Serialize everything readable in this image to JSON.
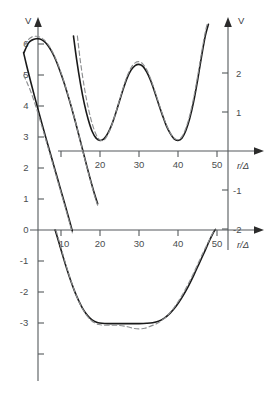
{
  "figure": {
    "name": "dual-axis-potential-plot",
    "background": "#ffffff",
    "width": 272,
    "height": 395,
    "colors": {
      "solid_curve": "#1a1a1a",
      "dashed_curve": "#8d8f91",
      "axis": "#55595c",
      "label": "#4a4e50"
    }
  },
  "chart_data": {
    "type": "line",
    "title": "",
    "subtitle": "",
    "grid": false,
    "legend": null,
    "axes": [
      {
        "id": "left-axis",
        "orientation": "vertical",
        "label": "V",
        "position": "left",
        "ticks": [
          6,
          5,
          4,
          3,
          2,
          1,
          0,
          -1,
          -2,
          -3
        ],
        "tick_labels": [
          "6",
          "5",
          "4",
          "3",
          "2",
          "1",
          "0",
          "-1",
          "-2",
          "-3"
        ],
        "range": [
          -3.3,
          6.6
        ]
      },
      {
        "id": "bottom-x-axis",
        "orientation": "horizontal",
        "label": "r/Δ",
        "position": "bottom",
        "ticks": [
          10,
          20,
          30,
          40,
          50
        ],
        "tick_labels": [
          "10",
          "20",
          "30",
          "40",
          "50"
        ],
        "range": [
          0,
          58
        ]
      },
      {
        "id": "right-axis",
        "orientation": "vertical",
        "label": "V",
        "position": "right",
        "ticks": [
          2,
          1,
          -1,
          -2
        ],
        "tick_labels": [
          "2",
          "1",
          "-1",
          "-2"
        ],
        "range": [
          -2.6,
          2.9
        ]
      },
      {
        "id": "middle-x-axis",
        "orientation": "horizontal",
        "label": "r/Δ",
        "position": "middle",
        "ticks": [
          20,
          30,
          40,
          50
        ],
        "tick_labels": [
          "20",
          "30",
          "40",
          "50"
        ],
        "range": [
          12,
          58
        ]
      }
    ],
    "xlabel": "r/Δ",
    "ylabel": "V",
    "series": [
      {
        "name": "upper-branch-solid",
        "style": "solid",
        "axis": "left",
        "points": [
          [
            0.5,
            5.72
          ],
          [
            1.6,
            6.02
          ],
          [
            2.6,
            6.13
          ],
          [
            3.6,
            6.17
          ],
          [
            4.6,
            6.16
          ],
          [
            5.6,
            6.09
          ],
          [
            6.6,
            5.96
          ],
          [
            7.6,
            5.76
          ],
          [
            8.6,
            5.5
          ],
          [
            9.6,
            5.18
          ],
          [
            10.6,
            4.82
          ],
          [
            11.6,
            4.42
          ],
          [
            12.6,
            3.99
          ],
          [
            13.6,
            3.53
          ],
          [
            14.6,
            3.05
          ],
          [
            15.6,
            2.56
          ],
          [
            16.6,
            2.07
          ],
          [
            17.6,
            1.6
          ],
          [
            18.6,
            1.16
          ],
          [
            19.4,
            0.85
          ]
        ]
      },
      {
        "name": "upper-branch-dashed",
        "style": "dashed",
        "axis": "left",
        "points": [
          [
            0.6,
            5.95
          ],
          [
            1.6,
            6.14
          ],
          [
            2.6,
            6.23
          ],
          [
            3.6,
            6.25
          ],
          [
            4.6,
            6.22
          ],
          [
            5.6,
            6.14
          ],
          [
            6.6,
            6.0
          ],
          [
            7.6,
            5.8
          ],
          [
            8.6,
            5.54
          ],
          [
            9.6,
            5.22
          ],
          [
            10.6,
            4.85
          ],
          [
            11.6,
            4.44
          ],
          [
            12.6,
            4.0
          ],
          [
            13.6,
            3.53
          ],
          [
            14.6,
            3.04
          ],
          [
            15.6,
            2.54
          ],
          [
            16.6,
            2.04
          ],
          [
            17.6,
            1.56
          ],
          [
            18.6,
            1.11
          ],
          [
            19.4,
            0.79
          ]
        ]
      },
      {
        "name": "steep-branch-solid",
        "style": "solid",
        "axis": "left",
        "points": [
          [
            0.4,
            5.72
          ],
          [
            1.2,
            5.3
          ],
          [
            2.2,
            4.8
          ],
          [
            3.2,
            4.32
          ],
          [
            4.2,
            3.85
          ],
          [
            5.2,
            3.39
          ],
          [
            6.2,
            2.94
          ],
          [
            7.2,
            2.5
          ],
          [
            8.2,
            2.06
          ],
          [
            9.2,
            1.62
          ],
          [
            10.2,
            1.18
          ],
          [
            11.2,
            0.74
          ],
          [
            12.2,
            0.29
          ],
          [
            12.9,
            -0.03
          ]
        ]
      },
      {
        "name": "steep-branch-dashed",
        "style": "dashed",
        "axis": "left",
        "points": [
          [
            0.4,
            5.0
          ],
          [
            1.2,
            4.78
          ],
          [
            2.2,
            4.48
          ],
          [
            3.2,
            4.12
          ],
          [
            4.2,
            3.72
          ],
          [
            5.2,
            3.3
          ],
          [
            6.2,
            2.87
          ],
          [
            7.2,
            2.44
          ],
          [
            8.2,
            2.0
          ],
          [
            9.2,
            1.56
          ],
          [
            10.2,
            1.12
          ],
          [
            11.2,
            0.68
          ],
          [
            12.2,
            0.23
          ],
          [
            12.9,
            -0.09
          ]
        ]
      },
      {
        "name": "oscillating-curve-solid",
        "style": "solid",
        "axis": "right",
        "comment": "double-well oscillation with minima near r=20 and r=40, local maximum near r=30",
        "points": [
          [
            13.2,
            2.95
          ],
          [
            14.0,
            2.35
          ],
          [
            15.0,
            1.72
          ],
          [
            16.0,
            1.2
          ],
          [
            17.0,
            0.8
          ],
          [
            18.0,
            0.5
          ],
          [
            19.0,
            0.33
          ],
          [
            20.0,
            0.27
          ],
          [
            21.0,
            0.31
          ],
          [
            22.0,
            0.45
          ],
          [
            23.0,
            0.67
          ],
          [
            24.0,
            0.96
          ],
          [
            25.0,
            1.28
          ],
          [
            26.0,
            1.6
          ],
          [
            27.0,
            1.88
          ],
          [
            28.0,
            2.08
          ],
          [
            29.0,
            2.19
          ],
          [
            30.0,
            2.22
          ],
          [
            31.0,
            2.17
          ],
          [
            32.0,
            2.02
          ],
          [
            33.0,
            1.8
          ],
          [
            34.0,
            1.52
          ],
          [
            35.0,
            1.21
          ],
          [
            36.0,
            0.92
          ],
          [
            37.0,
            0.65
          ],
          [
            38.0,
            0.45
          ],
          [
            39.0,
            0.31
          ],
          [
            40.0,
            0.27
          ],
          [
            41.0,
            0.33
          ],
          [
            42.0,
            0.52
          ],
          [
            43.0,
            0.83
          ],
          [
            44.0,
            1.26
          ],
          [
            45.0,
            1.8
          ],
          [
            46.0,
            2.4
          ],
          [
            47.0,
            2.95
          ],
          [
            47.8,
            3.25
          ]
        ]
      },
      {
        "name": "oscillating-curve-dashed",
        "style": "dashed",
        "axis": "right",
        "points": [
          [
            14.2,
            2.95
          ],
          [
            15.0,
            2.28
          ],
          [
            16.0,
            1.62
          ],
          [
            17.0,
            1.1
          ],
          [
            18.0,
            0.7
          ],
          [
            19.0,
            0.42
          ],
          [
            20.0,
            0.28
          ],
          [
            21.0,
            0.28
          ],
          [
            22.0,
            0.42
          ],
          [
            23.0,
            0.66
          ],
          [
            24.0,
            0.97
          ],
          [
            25.0,
            1.31
          ],
          [
            26.0,
            1.64
          ],
          [
            27.0,
            1.93
          ],
          [
            28.0,
            2.14
          ],
          [
            29.0,
            2.26
          ],
          [
            30.0,
            2.29
          ],
          [
            31.0,
            2.23
          ],
          [
            32.0,
            2.08
          ],
          [
            33.0,
            1.85
          ],
          [
            34.0,
            1.56
          ],
          [
            35.0,
            1.25
          ],
          [
            36.0,
            0.95
          ],
          [
            37.0,
            0.68
          ],
          [
            38.0,
            0.47
          ],
          [
            39.0,
            0.33
          ],
          [
            40.0,
            0.29
          ],
          [
            41.0,
            0.37
          ],
          [
            42.0,
            0.58
          ],
          [
            43.0,
            0.91
          ],
          [
            44.0,
            1.36
          ],
          [
            45.0,
            1.9
          ],
          [
            46.0,
            2.5
          ],
          [
            47.0,
            3.05
          ],
          [
            47.6,
            3.3
          ]
        ]
      },
      {
        "name": "lower-well-solid",
        "style": "solid",
        "axis": "left",
        "comment": "deep flat-bottomed well reaching -3.0 between r=20 and r=35",
        "points": [
          [
            8.5,
            0.0
          ],
          [
            9.5,
            -0.42
          ],
          [
            10.5,
            -0.85
          ],
          [
            11.5,
            -1.26
          ],
          [
            12.5,
            -1.64
          ],
          [
            13.5,
            -1.98
          ],
          [
            14.5,
            -2.27
          ],
          [
            15.5,
            -2.52
          ],
          [
            16.5,
            -2.71
          ],
          [
            17.5,
            -2.85
          ],
          [
            18.5,
            -2.94
          ],
          [
            19.5,
            -2.99
          ],
          [
            20.5,
            -3.01
          ],
          [
            22.0,
            -3.02
          ],
          [
            24.0,
            -3.02
          ],
          [
            26.0,
            -3.02
          ],
          [
            28.0,
            -3.02
          ],
          [
            30.0,
            -3.02
          ],
          [
            32.0,
            -3.01
          ],
          [
            33.5,
            -2.99
          ],
          [
            35.0,
            -2.94
          ],
          [
            36.5,
            -2.84
          ],
          [
            38.0,
            -2.68
          ],
          [
            39.5,
            -2.46
          ],
          [
            41.0,
            -2.18
          ],
          [
            42.5,
            -1.85
          ],
          [
            44.0,
            -1.47
          ],
          [
            45.5,
            -1.06
          ],
          [
            47.0,
            -0.65
          ],
          [
            48.0,
            -0.36
          ],
          [
            49.0,
            -0.1
          ],
          [
            49.6,
            0.02
          ]
        ]
      },
      {
        "name": "lower-well-dashed",
        "style": "dashed",
        "axis": "left",
        "points": [
          [
            8.7,
            0.0
          ],
          [
            9.7,
            -0.44
          ],
          [
            10.7,
            -0.88
          ],
          [
            11.7,
            -1.3
          ],
          [
            12.7,
            -1.69
          ],
          [
            13.7,
            -2.04
          ],
          [
            14.7,
            -2.34
          ],
          [
            15.7,
            -2.58
          ],
          [
            16.7,
            -2.77
          ],
          [
            17.7,
            -2.91
          ],
          [
            18.7,
            -3.0
          ],
          [
            19.7,
            -3.05
          ],
          [
            21.0,
            -3.07
          ],
          [
            23.0,
            -3.07
          ],
          [
            25.0,
            -3.08
          ],
          [
            27.0,
            -3.12
          ],
          [
            28.5,
            -3.17
          ],
          [
            30.0,
            -3.19
          ],
          [
            31.5,
            -3.17
          ],
          [
            33.0,
            -3.1
          ],
          [
            34.5,
            -3.02
          ],
          [
            36.0,
            -2.9
          ],
          [
            37.5,
            -2.73
          ],
          [
            39.0,
            -2.5
          ],
          [
            40.5,
            -2.22
          ],
          [
            42.0,
            -1.89
          ],
          [
            43.5,
            -1.52
          ],
          [
            45.0,
            -1.12
          ],
          [
            46.5,
            -0.71
          ],
          [
            47.8,
            -0.38
          ],
          [
            48.8,
            -0.12
          ],
          [
            49.5,
            0.01
          ]
        ]
      }
    ]
  }
}
